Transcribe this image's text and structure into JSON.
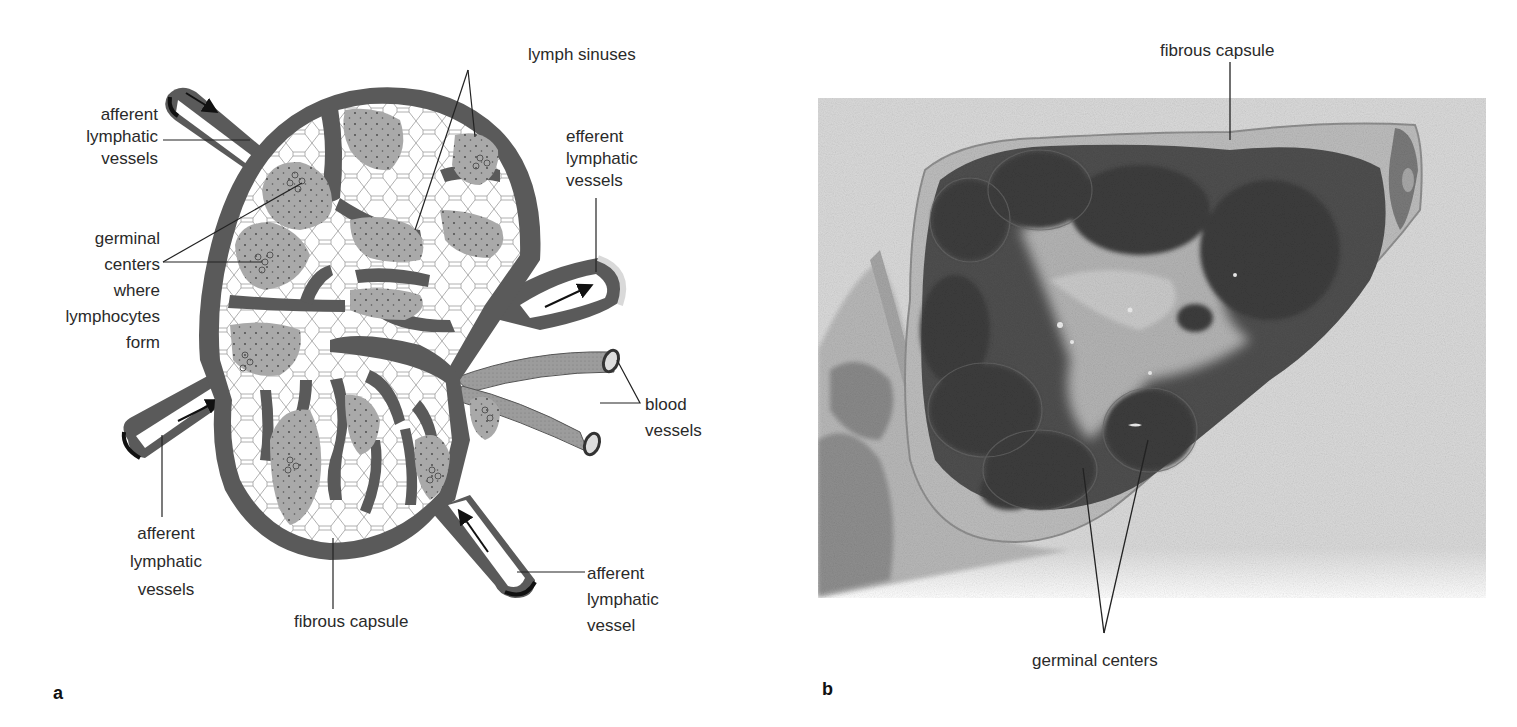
{
  "figure": {
    "panels": [
      {
        "id": "a",
        "type": "schematic diagram",
        "subject": "lymph node cross-section",
        "letter": "a",
        "labels": {
          "lymph_sinuses": "lymph sinuses",
          "afferent_top": [
            "afferent",
            "lymphatic",
            "vessels"
          ],
          "efferent": [
            "efferent",
            "lymphatic",
            "vessels"
          ],
          "germinal_centers": [
            "germinal",
            "centers",
            "where",
            "lymphocytes",
            "form"
          ],
          "blood_vessels": [
            "blood",
            "vessels"
          ],
          "afferent_left": [
            "afferent",
            "lymphatic",
            "vessels"
          ],
          "fibrous_capsule": "fibrous capsule",
          "afferent_bottom": [
            "afferent",
            "lymphatic",
            "vessel"
          ]
        }
      },
      {
        "id": "b",
        "type": "micrograph",
        "subject": "lymph node tissue section",
        "letter": "b",
        "labels": {
          "fibrous_capsule": "fibrous capsule",
          "germinal_centers": "germinal centers"
        }
      }
    ],
    "colors": {
      "capsule_dark": "#5a5a5a",
      "germinal_gray": "#a9a9a9",
      "sinus_white": "#ffffff",
      "mesh_line": "#9a9a9a",
      "photo_bg": "#d9d9d9",
      "tissue_dark": "#4a4a4a",
      "label_text": "#2a2a2a"
    }
  }
}
